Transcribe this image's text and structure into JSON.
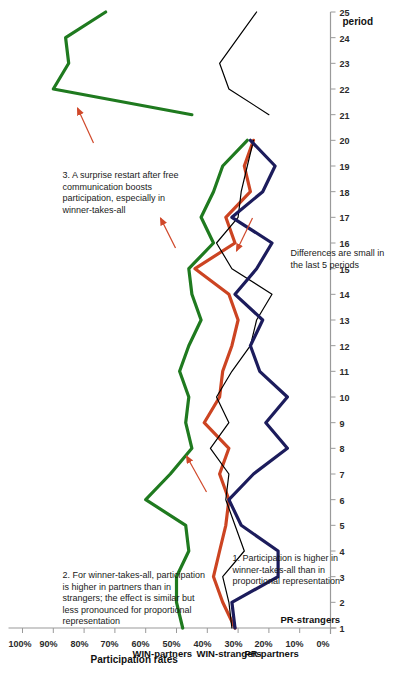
{
  "chart_data": {
    "type": "line",
    "title": "",
    "xlabel": "period",
    "ylabel": "Participation rates",
    "x": [
      1,
      2,
      3,
      4,
      5,
      6,
      7,
      8,
      9,
      10,
      11,
      12,
      13,
      14,
      15,
      16,
      17,
      18,
      19,
      20,
      21,
      22,
      23,
      24,
      25
    ],
    "xlim": [
      1,
      25
    ],
    "ylim": [
      0,
      100
    ],
    "ytick_labels": [
      "0%",
      "10%",
      "20%",
      "30%",
      "40%",
      "50%",
      "60%",
      "70%",
      "80%",
      "90%",
      "100%"
    ],
    "ytick_values": [
      0,
      10,
      20,
      30,
      40,
      50,
      60,
      70,
      80,
      90,
      100
    ],
    "xtick_labels": [
      "1",
      "2",
      "3",
      "4",
      "5",
      "6",
      "7",
      "8",
      "9",
      "10",
      "11",
      "12",
      "13",
      "14",
      "15",
      "16",
      "17",
      "18",
      "19",
      "20",
      "21",
      "22",
      "23",
      "24",
      "25"
    ],
    "grid": false,
    "legend_position": "inline-labels",
    "restart_gap_after_period": 20,
    "series": [
      {
        "name": "WIN-partners",
        "color": "#1f7a1f",
        "x": [
          1,
          2,
          3,
          4,
          5,
          6,
          7,
          8,
          9,
          10,
          11,
          12,
          13,
          14,
          15,
          16,
          17,
          18,
          19,
          20,
          21,
          22,
          23,
          24,
          25
        ],
        "values": [
          48,
          50,
          50,
          46,
          47,
          60,
          52,
          45,
          47,
          46,
          49,
          46,
          42,
          45,
          46,
          38,
          42,
          38,
          35,
          27,
          45,
          90,
          85,
          86,
          73
        ]
      },
      {
        "name": "WIN-strangers",
        "color": "#cc4422",
        "x": [
          1,
          2,
          3,
          4,
          5,
          6,
          7,
          8,
          9,
          10,
          11,
          12,
          13,
          14,
          15,
          16,
          17,
          18,
          19,
          20
        ],
        "values": [
          31,
          35,
          38,
          36,
          34,
          33,
          36,
          33,
          41,
          36,
          35,
          32,
          30,
          33,
          44,
          31,
          34,
          26,
          28,
          25
        ]
      },
      {
        "name": "PR-partners",
        "color": "#000000",
        "x": [
          1,
          2,
          3,
          4,
          5,
          6,
          7,
          8,
          9,
          10,
          11,
          12,
          13,
          14,
          15,
          16,
          17,
          18,
          19,
          20,
          21,
          22,
          23,
          24,
          25
        ],
        "values": [
          32,
          33,
          35,
          28,
          31,
          34,
          33,
          39,
          33,
          37,
          32,
          26,
          24,
          19,
          32,
          37,
          30,
          29,
          27,
          25,
          20,
          33,
          36,
          30,
          24
        ]
      },
      {
        "name": "PR-strangers",
        "color": "#1c1c5c",
        "x": [
          1,
          2,
          3,
          4,
          5,
          6,
          7,
          8,
          9,
          10,
          11,
          12,
          13,
          14,
          15,
          16,
          17,
          18,
          19,
          20
        ],
        "values": [
          31,
          32,
          17,
          17,
          29,
          33,
          25,
          14,
          21,
          14,
          23,
          26,
          22,
          31,
          24,
          19,
          32,
          22,
          18,
          26
        ]
      }
    ]
  },
  "axes": {
    "y_axis_title": "Participation rates",
    "x_axis_title": "period"
  },
  "series_labels": [
    {
      "name": "WIN-partners",
      "text": "WIN-partners"
    },
    {
      "name": "WIN-strangers",
      "text": "WIN-strangers"
    },
    {
      "name": "PR-partners",
      "text": "PR-partners"
    },
    {
      "name": "PR-strangers",
      "text": "PR-strangers"
    }
  ],
  "annotations": [
    {
      "name": "annotation-1",
      "text": "1. Participation is higher in winner-takes-all than in proportional representation"
    },
    {
      "name": "annotation-2",
      "text": "2.  For winner-takes-all, participation is higher in partners than in strangers; the effect is similar but less pronounced for proportional representation"
    },
    {
      "name": "annotation-3",
      "text": "3. A surprise restart after free communication boosts participation, especially in winner-takes-all"
    },
    {
      "name": "annotation-differences",
      "text": "Differences are small in the last 5 periods"
    }
  ],
  "colors": {
    "win_partners": "#1f7a1f",
    "win_strangers": "#cc4422",
    "pr_partners": "#000000",
    "pr_strangers": "#1c1c5c",
    "arrow": "#d0482a",
    "axis": "#9a9a9a"
  }
}
